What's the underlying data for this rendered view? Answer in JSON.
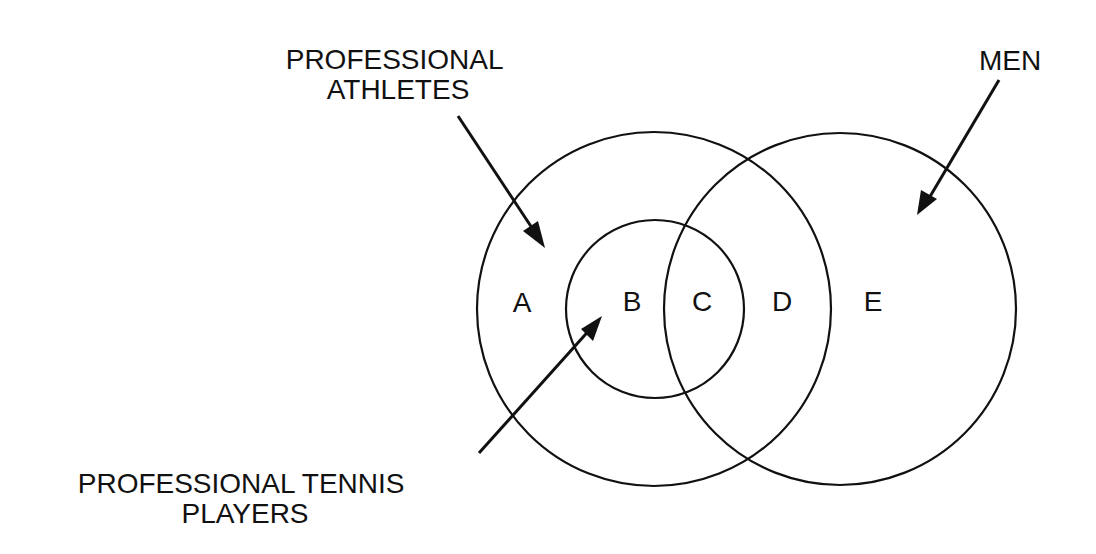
{
  "diagram": {
    "type": "venn",
    "stroke_color": "#111111",
    "background": "#ffffff",
    "sets": [
      {
        "id": "athletes",
        "label_lines": [
          "PROFESSIONAL",
          "ATHLETES"
        ]
      },
      {
        "id": "men",
        "label_lines": [
          "MEN"
        ]
      },
      {
        "id": "tennis",
        "label_lines": [
          "PROFESSIONAL TENNIS",
          "PLAYERS"
        ]
      }
    ],
    "regions": [
      {
        "id": "A",
        "label": "A"
      },
      {
        "id": "B",
        "label": "B"
      },
      {
        "id": "C",
        "label": "C"
      },
      {
        "id": "D",
        "label": "D"
      },
      {
        "id": "E",
        "label": "E"
      }
    ]
  }
}
